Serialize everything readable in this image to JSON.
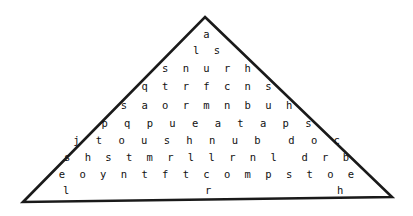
{
  "figure": {
    "kind": "triangular-letter-grid-puzzle",
    "shape_label": "triangle",
    "background_color": "#ffffff",
    "outline_color": "#1a1a1a",
    "letter_color": "#111111",
    "outline_points": "205,17 392,197 23,202",
    "rows": [
      {
        "id": "row-1",
        "top": 28,
        "text": "a",
        "spacing": 0
      },
      {
        "id": "row-2",
        "top": 44,
        "text": "l s",
        "spacing": 4
      },
      {
        "id": "row-3",
        "top": 62,
        "text": "s n u r h",
        "spacing": 4
      },
      {
        "id": "row-4",
        "top": 80,
        "text": "q t r f c n s",
        "spacing": 4
      },
      {
        "id": "row-5",
        "top": 99,
        "text": "s a o r m n b u h",
        "spacing": 4
      },
      {
        "id": "row-6",
        "top": 117,
        "text": "p q p u e a t a p s",
        "spacing": 5
      },
      {
        "id": "row-7",
        "top": 134,
        "text": "j t o u s h n u b  d o c",
        "spacing": 5
      },
      {
        "id": "row-8",
        "top": 151,
        "text": "s h s t m r l l r n l  d r b",
        "spacing": 4
      },
      {
        "id": "row-9",
        "top": 168,
        "text": "e o y n t f t c o m p s t o e",
        "spacing": 4
      }
    ],
    "bottom_row": {
      "id": "row-10",
      "top": 184,
      "letters": [
        {
          "char": "l",
          "x": 63
        },
        {
          "char": "r",
          "x": 205
        },
        {
          "char": "h",
          "x": 337
        }
      ]
    }
  }
}
